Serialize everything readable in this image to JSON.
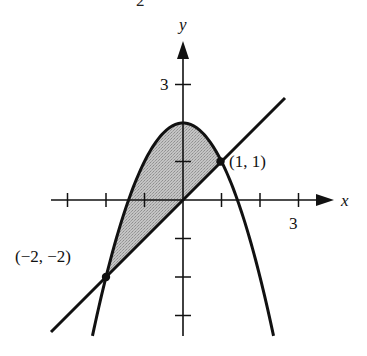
{
  "figure": {
    "top_fragment": "2",
    "x_axis": {
      "label": "x",
      "tick_label": "3",
      "ticks": [
        -3,
        -2,
        -1,
        1,
        2,
        3
      ]
    },
    "y_axis": {
      "label": "y",
      "tick_label": "3",
      "ticks": [
        -3,
        -2,
        -1,
        1,
        2,
        3
      ]
    },
    "curves": [
      {
        "name": "parabola",
        "equation": "y = 2 - x^2"
      },
      {
        "name": "line",
        "equation": "y = x"
      }
    ],
    "shaded_region": {
      "description": "region between y = 2 - x^2 (above) and y = x (below), for -2 <= x <= 1",
      "color": "#b5b5b5"
    },
    "points": [
      {
        "label": "(1, 1)",
        "x": 1,
        "y": 1
      },
      {
        "label": "(−2, −2)",
        "x": -2,
        "y": -2
      }
    ],
    "colors": {
      "stroke": "#111111",
      "fill": "#b5b5b5",
      "background": "#ffffff"
    }
  }
}
